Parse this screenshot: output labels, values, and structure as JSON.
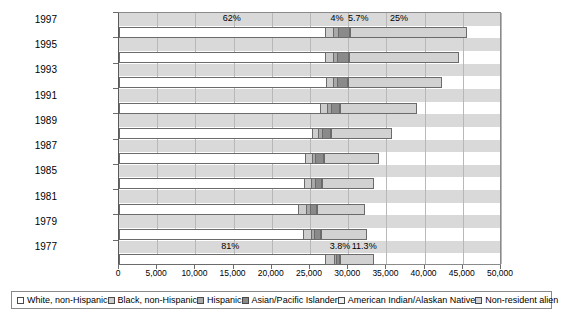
{
  "chart_data": {
    "type": "bar",
    "orientation": "horizontal",
    "stacked": true,
    "title": "",
    "subtitle": "",
    "xlabel": "",
    "ylabel": "",
    "xlim": [
      0,
      50000
    ],
    "grid": true,
    "legend_position": "bottom",
    "categories": [
      "1997",
      "1995",
      "1993",
      "1991",
      "1989",
      "1987",
      "1985",
      "1981",
      "1979",
      "1977"
    ],
    "xticks": [
      0,
      5000,
      10000,
      15000,
      20000,
      25000,
      30000,
      35000,
      40000,
      45000,
      50000
    ],
    "xticklabels": [
      "0",
      "5,000",
      "10,000",
      "15,000",
      "20,000",
      "25,000",
      "30,000",
      "35,000",
      "40,000",
      "45,000",
      "50,000"
    ],
    "series": [
      {
        "name": "White, non-Hispanic",
        "color": "#ffffff",
        "values": [
          27000,
          27000,
          27100,
          26300,
          25200,
          24400,
          24200,
          23400,
          24100,
          26900
        ]
      },
      {
        "name": "Black, non-Hispanic",
        "color": "#cdcdcd",
        "values": [
          1050,
          1000,
          950,
          900,
          900,
          850,
          950,
          1050,
          1000,
          1250
        ]
      },
      {
        "name": "Hispanic",
        "color": "#a8a8a8",
        "values": [
          600,
          570,
          520,
          500,
          480,
          470,
          450,
          500,
          450,
          280
        ]
      },
      {
        "name": "Asian/Pacific Islander",
        "color": "#8a8a8a",
        "values": [
          1500,
          1450,
          1300,
          1150,
          1050,
          950,
          900,
          880,
          800,
          420
        ]
      },
      {
        "name": "American Indian/Alaskan Native",
        "color": "#f0f0f0",
        "values": [
          130,
          120,
          110,
          100,
          95,
          90,
          85,
          85,
          80,
          60
        ]
      },
      {
        "name": "Non-resident alien",
        "color": "#d2d2d2",
        "values": [
          15300,
          14400,
          12300,
          10000,
          8000,
          7200,
          6800,
          6300,
          6000,
          4400
        ]
      }
    ],
    "annotations": [
      {
        "text": "62%",
        "x": 13700,
        "row": "1997",
        "position": "above"
      },
      {
        "text": "4%",
        "x": 27800,
        "row": "1997",
        "position": "above"
      },
      {
        "text": "5.7%",
        "x": 30100,
        "row": "1997",
        "position": "above"
      },
      {
        "text": "25%",
        "x": 35600,
        "row": "1997",
        "position": "above"
      },
      {
        "text": "81%",
        "x": 13500,
        "row": "1977",
        "position": "above"
      },
      {
        "text": "3.8%",
        "x": 27700,
        "row": "1977",
        "position": "above"
      },
      {
        "text": "11.3%",
        "x": 30600,
        "row": "1977",
        "position": "above"
      }
    ]
  },
  "legend": {
    "items": [
      {
        "label": "White, non-Hispanic",
        "color": "#ffffff",
        "name": "white-non-hispanic"
      },
      {
        "label": "Black, non-Hispanic",
        "color": "#cdcdcd",
        "name": "black-non-hispanic"
      },
      {
        "label": "Hispanic",
        "color": "#a8a8a8",
        "name": "hispanic"
      },
      {
        "label": "Asian/Pacific Islander",
        "color": "#8a8a8a",
        "name": "asian-pacific-islander"
      },
      {
        "label": "American Indian/Alaskan Native",
        "color": "#f0f0f0",
        "name": "american-indian-alaskan-native"
      },
      {
        "label": "Non-resident alien",
        "color": "#d2d2d2",
        "name": "non-resident-alien"
      }
    ]
  }
}
